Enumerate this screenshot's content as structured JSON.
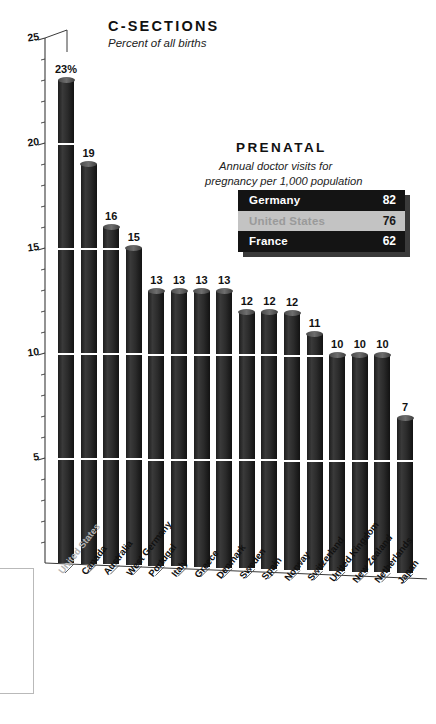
{
  "chart_data": {
    "type": "bar",
    "title": "C-SECTIONS",
    "subtitle": "Percent of all births",
    "xlabel": "",
    "ylabel": "",
    "ylim": [
      0,
      25
    ],
    "grid": true,
    "y_ticks": [
      5,
      10,
      15,
      20,
      25
    ],
    "y_tick_labels": [
      "5",
      "10",
      "15",
      "20",
      "25"
    ],
    "legend": "none",
    "highlight_category": "United States",
    "categories": [
      "United States",
      "Canada",
      "Australia",
      "West Germany",
      "Portugal",
      "Italy",
      "Greece",
      "Denmark",
      "Sweden",
      "Spain",
      "Norway",
      "Switzerland",
      "United Kingdom",
      "New Zealand",
      "Netherlands",
      "Japan"
    ],
    "values": [
      23,
      19,
      16,
      15,
      13,
      13,
      13,
      13,
      12,
      12,
      12,
      11,
      10,
      10,
      10,
      7
    ],
    "value_labels": [
      "23%",
      "19",
      "16",
      "15",
      "13",
      "13",
      "13",
      "13",
      "12",
      "12",
      "12",
      "11",
      "10",
      "10",
      "10",
      "7"
    ]
  },
  "chart": {
    "title": "C-SECTIONS",
    "subtitle": "Percent of all births"
  },
  "prenatal": {
    "title": "PRENATAL",
    "subtitle_line1": "Annual doctor visits for",
    "subtitle_line2": "pregnancy per 1,000 population",
    "rows": [
      {
        "name": "Germany",
        "value": "82",
        "highlighted": false
      },
      {
        "name": "United States",
        "value": "76",
        "highlighted": true
      },
      {
        "name": "France",
        "value": "62",
        "highlighted": false
      }
    ]
  },
  "colors": {
    "bar": "#262626",
    "bar_cap": "#5a5a5a",
    "table_bg": "#141414",
    "table_highlight": "#c3c3c3",
    "highlight_text": "#9a9a9a",
    "page_bg": "#ffffff",
    "text": "#111111"
  }
}
